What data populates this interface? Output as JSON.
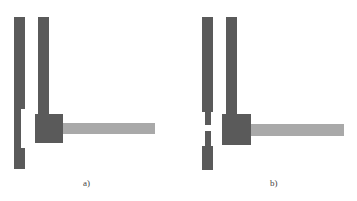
{
  "figure": {
    "panels": [
      {
        "id": "a",
        "label": "a)",
        "description": "Continuous left strip with a notch; vertical feed line joined to square pad with horizontal light bar"
      },
      {
        "id": "b",
        "label": "b)",
        "description": "Left strip narrowed into a neck with a break; vertical feed line joined to square pad with horizontal light bar"
      }
    ],
    "colors": {
      "dark_metal": "#5a5a5a",
      "light_metal": "#a9a9a9",
      "background": "#ffffff"
    }
  }
}
